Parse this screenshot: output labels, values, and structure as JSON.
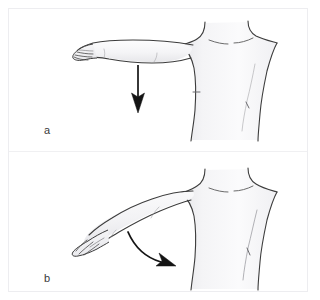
{
  "figure": {
    "background_color": "#ffffff",
    "border_color": "#ededf0",
    "outline_color": "#3c3c3c",
    "skin_fill_color": "#f7f7f8",
    "shade_color": "#e4e4e7",
    "arrow_color": "#141414",
    "width": 320,
    "height": 300
  },
  "panels": [
    {
      "id": "a",
      "label": "a",
      "description": "Torso with right arm abducted horizontally to the side, straight downward arrow indicating the direction of movement",
      "arrow": {
        "type": "straight",
        "direction": "down",
        "start_x": 138,
        "start_y": 65,
        "end_x": 138,
        "end_y": 112
      },
      "figure_parts": [
        "head-base",
        "neck",
        "left-clavicle",
        "right-clavicle",
        "chest",
        "abdomen",
        "right-shoulder",
        "outstretched-arm",
        "forearm",
        "hand",
        "fingers",
        "nipple-left",
        "nipple-right"
      ]
    },
    {
      "id": "b",
      "label": "b",
      "description": "Torso with right arm lowered diagonally, curved arrow indicating adduction toward the body",
      "arrow": {
        "type": "curved",
        "direction": "down-right",
        "start_x": 128,
        "start_y": 232,
        "end_x": 170,
        "end_y": 263
      },
      "figure_parts": [
        "head-base",
        "neck",
        "left-clavicle",
        "right-clavicle",
        "chest",
        "abdomen",
        "right-shoulder",
        "lowered-arm",
        "forearm",
        "hand",
        "fingers",
        "nipple-right"
      ]
    }
  ]
}
